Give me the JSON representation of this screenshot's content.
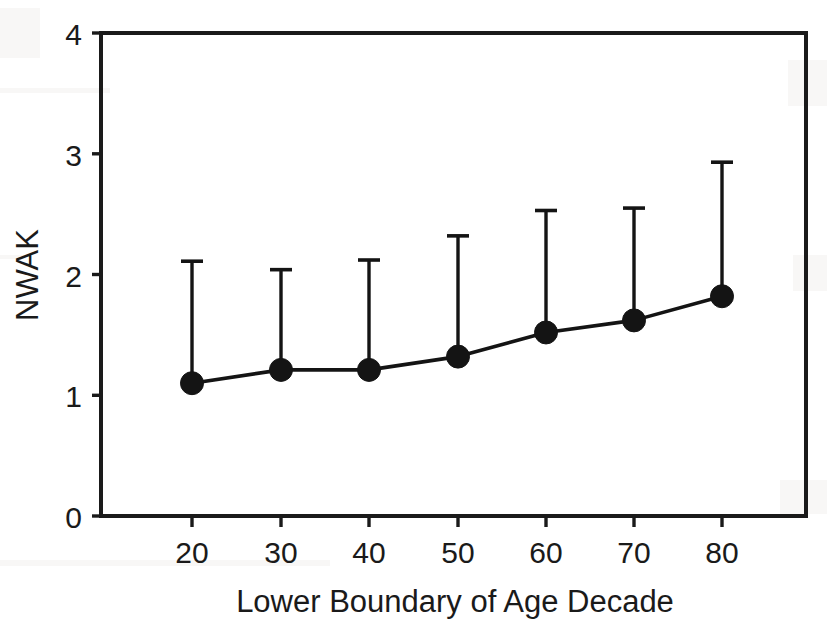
{
  "chart_data": {
    "type": "line",
    "title": "",
    "subtitle": "",
    "xlabel": "Lower Boundary of Age Decade",
    "ylabel": "NWAK",
    "x": [
      20,
      30,
      40,
      50,
      60,
      70,
      80
    ],
    "categories": [
      "20",
      "30",
      "40",
      "50",
      "60",
      "70",
      "80"
    ],
    "xtick_labels": [
      "20",
      "30",
      "40",
      "50",
      "60",
      "70",
      "80"
    ],
    "ytick_labels": [
      "0",
      "1",
      "2",
      "3",
      "4"
    ],
    "yticks": [
      0,
      1,
      2,
      3,
      4
    ],
    "xlim": [
      10,
      89
    ],
    "ylim": [
      0,
      4
    ],
    "grid": false,
    "legend": null,
    "legend_position": "none",
    "marker": "filled-circle",
    "error_bars": "upper-only",
    "series": [
      {
        "name": "NWAK",
        "values": [
          1.1,
          1.21,
          1.21,
          1.32,
          1.52,
          1.62,
          1.82
        ],
        "error_upper": [
          2.11,
          2.04,
          2.12,
          2.32,
          2.53,
          2.55,
          2.93
        ],
        "error_lower": [
          null,
          null,
          null,
          null,
          null,
          null,
          null
        ],
        "color": "#141414"
      }
    ],
    "annotations": []
  },
  "axes": {
    "y_title": "NWAK",
    "x_title": "Lower Boundary of Age Decade"
  },
  "colors": {
    "ink": "#141414",
    "background": "#ffffff"
  }
}
